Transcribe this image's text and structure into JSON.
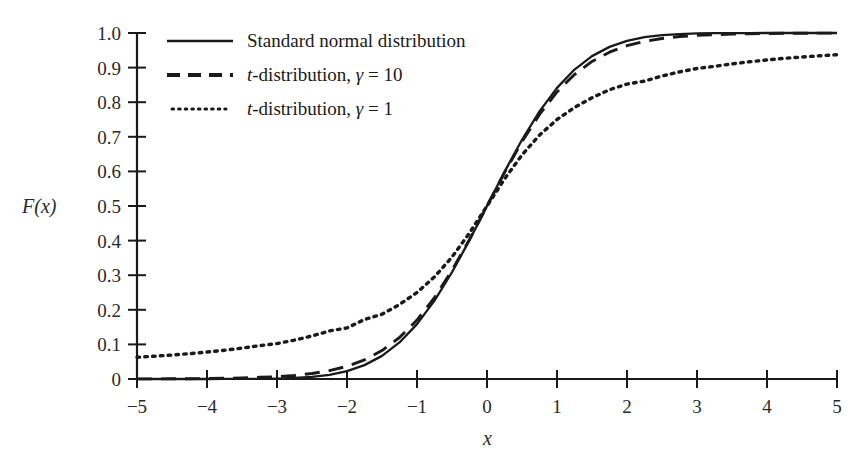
{
  "chart_data": {
    "type": "line",
    "title": "",
    "subtitle": "",
    "xlabel": "x",
    "ylabel": "F(x)",
    "xlim": [
      -5,
      5
    ],
    "ylim": [
      0,
      1.0
    ],
    "grid": false,
    "legend_position": "top-left-inside",
    "x_ticks": [
      -5,
      -4,
      -3,
      -2,
      -1,
      0,
      1,
      2,
      3,
      4,
      5
    ],
    "x_tick_labels": [
      "−5",
      "−4",
      "−3",
      "−2",
      "−1",
      "0",
      "1",
      "2",
      "3",
      "4",
      "5"
    ],
    "y_ticks": [
      0,
      0.1,
      0.2,
      0.3,
      0.4,
      0.5,
      0.6,
      0.7,
      0.8,
      0.9,
      1.0
    ],
    "y_tick_labels": [
      "0",
      "0.1",
      "0.2",
      "0.3",
      "0.4",
      "0.5",
      "0.6",
      "0.7",
      "0.8",
      "0.9",
      "1.0"
    ],
    "x": [
      -5,
      -4.75,
      -4.5,
      -4.25,
      -4,
      -3.75,
      -3.5,
      -3.25,
      -3,
      -2.75,
      -2.5,
      -2.25,
      -2,
      -1.75,
      -1.5,
      -1.25,
      -1,
      -0.75,
      -0.5,
      -0.25,
      0,
      0.25,
      0.5,
      0.75,
      1,
      1.25,
      1.5,
      1.75,
      2,
      2.25,
      2.5,
      2.75,
      3,
      3.25,
      3.5,
      3.75,
      4,
      4.25,
      4.5,
      4.75,
      5
    ],
    "series": [
      {
        "name": "Standard normal distribution",
        "style": "solid",
        "color": "#1a1a1a",
        "values": [
          3e-07,
          1e-06,
          3.4e-06,
          1.07e-05,
          3.17e-05,
          8.84e-05,
          0.000233,
          0.000577,
          0.00135,
          0.00298,
          0.00621,
          0.01222,
          0.02275,
          0.04006,
          0.06681,
          0.10565,
          0.15866,
          0.22663,
          0.30854,
          0.40129,
          0.5,
          0.59871,
          0.69146,
          0.77337,
          0.84134,
          0.89435,
          0.93319,
          0.95994,
          0.97725,
          0.98778,
          0.99379,
          0.99702,
          0.99865,
          0.99942,
          0.99977,
          0.99991,
          0.99997,
          0.99999,
          0.999997,
          0.999999,
          1.0
        ]
      },
      {
        "name": "t-distribution, γ = 10",
        "style": "dashed",
        "color": "#1a1a1a",
        "gamma": 10,
        "values": [
          0.00027,
          0.00039,
          0.00057,
          0.00085,
          0.00129,
          0.00199,
          0.00311,
          0.00496,
          0.00667,
          0.01025,
          0.01581,
          0.02414,
          0.03671,
          0.05537,
          0.08225,
          0.11987,
          0.17038,
          0.23529,
          0.31402,
          0.40358,
          0.5,
          0.59642,
          0.68598,
          0.76471,
          0.82962,
          0.88013,
          0.91775,
          0.94463,
          0.96329,
          0.97586,
          0.98419,
          0.98975,
          0.99333,
          0.99504,
          0.99689,
          0.99801,
          0.99871,
          0.99915,
          0.99943,
          0.99961,
          0.99973
        ]
      },
      {
        "name": "t-distribution, γ = 1",
        "style": "dotted",
        "color": "#1a1a1a",
        "gamma": 1,
        "values": [
          0.06283,
          0.06591,
          0.06935,
          0.07322,
          0.07797,
          0.08313,
          0.0892,
          0.09643,
          0.10242,
          0.11239,
          0.12437,
          0.13899,
          0.14758,
          0.17202,
          0.18717,
          0.21535,
          0.25,
          0.29517,
          0.35242,
          0.42202,
          0.5,
          0.57798,
          0.64758,
          0.70483,
          0.75,
          0.78465,
          0.81283,
          0.83602,
          0.85242,
          0.86101,
          0.87563,
          0.88761,
          0.89758,
          0.90357,
          0.9108,
          0.91687,
          0.92202,
          0.92678,
          0.93065,
          0.93409,
          0.93717
        ]
      }
    ],
    "legend": [
      {
        "label_prefix": "",
        "label_italic": "",
        "label": "Standard normal distribution",
        "style": "solid"
      },
      {
        "label_prefix": "",
        "label_italic": "t",
        "label": "-distribution, γ = 10",
        "style": "dashed"
      },
      {
        "label_prefix": "",
        "label_italic": "t",
        "label": "-distribution, γ = 1",
        "style": "dotted"
      }
    ]
  }
}
